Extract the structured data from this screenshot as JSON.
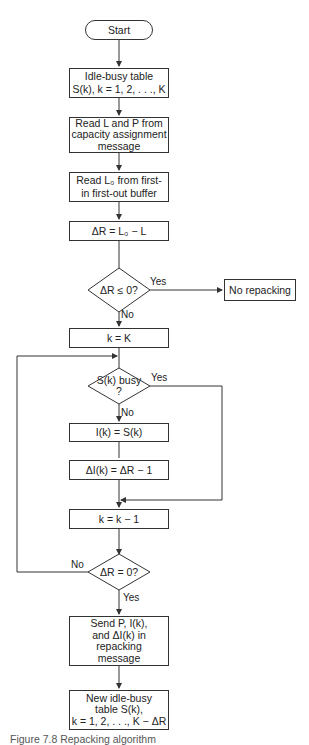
{
  "flowchart": {
    "start": "Start",
    "idle_busy_table": [
      "Idle-busy table",
      "S(k), k = 1, 2, . . ., K"
    ],
    "read_L_P": [
      "Read L and P from",
      "capacity assignment",
      "message"
    ],
    "read_Lo": [
      "Read L₀ from first-",
      "in first-out buffer"
    ],
    "delta_R": "ΔR = L₀ − L",
    "decision_delta_R_le_0": "ΔR ≤ 0?",
    "no_repacking": "No repacking",
    "set_k": "k = K",
    "decision_busy": [
      "S(k) busy",
      "?"
    ],
    "assign_I": "I(k) = S(k)",
    "assign_delta_I": "ΔI(k) = ΔR − 1",
    "decrement_k": "k = k − 1",
    "decision_delta_R_eq_0": "ΔR = 0?",
    "send": [
      "Send P, I(k),",
      "and ΔI(k) in",
      "repacking",
      "message"
    ],
    "new_table": [
      "New idle-busy",
      "table S(k),",
      "k = 1, 2, . . ., K − ΔR"
    ]
  },
  "labels": {
    "yes": "Yes",
    "no": "No"
  },
  "caption": "Figure 7.8 Repacking algorithm"
}
